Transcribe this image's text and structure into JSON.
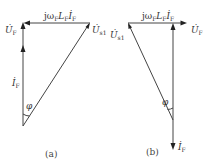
{
  "figure": {
    "panels": [
      {
        "caption": "(a)",
        "labels": {
          "uf": "U̇",
          "uf_sub": "F",
          "us1": "U̇",
          "us1_sub": "s1",
          "if": "İ",
          "if_sub": "F",
          "phi": "φ",
          "jwl_prefix": "jω",
          "jwl_sub1": "F",
          "jwl_mid": "L",
          "jwl_sub2": "F",
          "jwl_i": "İ",
          "jwl_sub3": "F"
        }
      },
      {
        "caption": "(b)",
        "labels": {
          "uf": "U̇",
          "uf_sub": "F",
          "us1": "U̇",
          "us1_sub": "s1",
          "if": "İ",
          "if_sub": "F",
          "phi": "φ",
          "jwl_prefix": "jω",
          "jwl_sub1": "F",
          "jwl_mid": "L",
          "jwl_sub2": "F",
          "jwl_i": "İ",
          "jwl_sub3": "F"
        }
      }
    ]
  }
}
